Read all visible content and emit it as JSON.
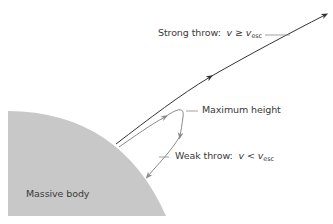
{
  "diagram": {
    "title": "",
    "body": {
      "label": "Massive body",
      "fill": "#c8c8c8"
    },
    "strong_throw": {
      "label_prefix": "Strong throw:",
      "var": "v",
      "relation": "≥",
      "rhs_var": "v",
      "rhs_sub": "esc",
      "line_color": "#333333"
    },
    "weak_throw": {
      "label_prefix": "Weak throw:",
      "var": "v",
      "relation": "<",
      "rhs_var": "v",
      "rhs_sub": "esc",
      "line_color": "#8a8a8a"
    },
    "max_height": {
      "label": "Maximum height"
    }
  }
}
